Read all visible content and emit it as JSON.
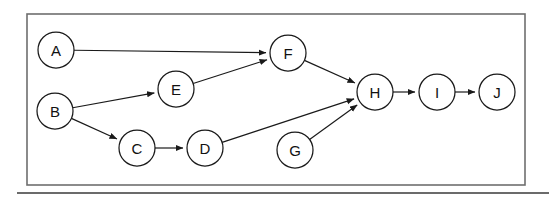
{
  "diagram": {
    "type": "directed-graph",
    "colors": {
      "node_fill": "#ffffff",
      "node_stroke": "#1a1a1a",
      "edge_stroke": "#1a1a1a",
      "frame_stroke": "#6e6e6e",
      "rule_stroke": "#3a3a3a",
      "background": "#ffffff",
      "label_fill": "#111111"
    },
    "frame": {
      "x": 27,
      "y": 14,
      "width": 498,
      "height": 171
    },
    "rule": {
      "x1": 17,
      "y1": 193,
      "x2": 549,
      "y2": 193
    },
    "node_radius": 18,
    "nodes": [
      {
        "id": "A",
        "label": "A",
        "cx": 56,
        "cy": 50
      },
      {
        "id": "B",
        "label": "B",
        "cx": 55,
        "cy": 111
      },
      {
        "id": "C",
        "label": "C",
        "cx": 137,
        "cy": 148
      },
      {
        "id": "D",
        "label": "D",
        "cx": 205,
        "cy": 148
      },
      {
        "id": "E",
        "label": "E",
        "cx": 176,
        "cy": 89
      },
      {
        "id": "F",
        "label": "F",
        "cx": 288,
        "cy": 53
      },
      {
        "id": "G",
        "label": "G",
        "cx": 295,
        "cy": 150
      },
      {
        "id": "H",
        "label": "H",
        "cx": 375,
        "cy": 92
      },
      {
        "id": "I",
        "label": "I",
        "cx": 437,
        "cy": 92
      },
      {
        "id": "J",
        "label": "J",
        "cx": 497,
        "cy": 92
      }
    ],
    "edges": [
      {
        "from": "A",
        "to": "F",
        "directed": true
      },
      {
        "from": "B",
        "to": "E",
        "directed": true
      },
      {
        "from": "B",
        "to": "C",
        "directed": true
      },
      {
        "from": "C",
        "to": "D",
        "directed": true
      },
      {
        "from": "D",
        "to": "H",
        "directed": true
      },
      {
        "from": "E",
        "to": "F",
        "directed": true
      },
      {
        "from": "F",
        "to": "H",
        "directed": true
      },
      {
        "from": "G",
        "to": "H",
        "directed": true
      },
      {
        "from": "H",
        "to": "I",
        "directed": true
      },
      {
        "from": "I",
        "to": "J",
        "directed": true
      }
    ]
  }
}
